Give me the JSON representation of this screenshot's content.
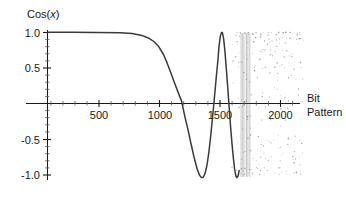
{
  "chart_data": {
    "type": "line",
    "title": "Cos(x)",
    "xlabel": "Bit Pattern",
    "ylabel": "Cos(x)",
    "xlim": [
      0,
      2150
    ],
    "ylim": [
      -1.15,
      1.15
    ],
    "grid": false,
    "legend": null,
    "x_ticks": [
      500,
      1000,
      1500,
      2000
    ],
    "x_tick_labels": [
      "500",
      "1000",
      "1500",
      "2000"
    ],
    "y_ticks": [
      -1.0,
      -0.5,
      0.5,
      1.0
    ],
    "y_tick_labels": [
      "-1.0",
      "-0.5",
      "0.5",
      "1.0"
    ],
    "y_zero_line": 0,
    "minor_ticks": true,
    "series": [
      {
        "name": "Cos(x)",
        "color": "#3a3a3a",
        "description": "Cosine of a rapidly growing argument; period shrinks with x so sampling aliases into noise beyond x~1450",
        "regime_smooth_end": 1450,
        "regime_aliased_start": 1450,
        "samples_note": "Curve traced from plotted pixels",
        "key_points": [
          {
            "x": 0,
            "y": 1.0
          },
          {
            "x": 200,
            "y": 1.0
          },
          {
            "x": 400,
            "y": 1.0
          },
          {
            "x": 600,
            "y": 0.99
          },
          {
            "x": 700,
            "y": 0.97
          },
          {
            "x": 780,
            "y": 0.92
          },
          {
            "x": 840,
            "y": 0.83
          },
          {
            "x": 880,
            "y": 0.72
          },
          {
            "x": 920,
            "y": 0.55
          },
          {
            "x": 960,
            "y": 0.33
          },
          {
            "x": 1000,
            "y": 0.06
          },
          {
            "x": 1030,
            "y": -0.2
          },
          {
            "x": 1060,
            "y": -0.47
          },
          {
            "x": 1090,
            "y": -0.72
          },
          {
            "x": 1120,
            "y": -0.91
          },
          {
            "x": 1150,
            "y": -1.0
          },
          {
            "x": 1180,
            "y": -0.95
          },
          {
            "x": 1205,
            "y": -0.78
          },
          {
            "x": 1230,
            "y": -0.45
          },
          {
            "x": 1255,
            "y": -0.05
          },
          {
            "x": 1275,
            "y": 0.4
          },
          {
            "x": 1295,
            "y": 0.78
          },
          {
            "x": 1315,
            "y": 0.98
          },
          {
            "x": 1330,
            "y": 1.0
          },
          {
            "x": 1345,
            "y": 0.88
          },
          {
            "x": 1362,
            "y": 0.55
          },
          {
            "x": 1378,
            "y": 0.1
          },
          {
            "x": 1392,
            "y": -0.4
          },
          {
            "x": 1406,
            "y": -0.78
          },
          {
            "x": 1420,
            "y": -0.97
          },
          {
            "x": 1432,
            "y": -1.0
          },
          {
            "x": 1445,
            "y": -0.88
          }
        ]
      }
    ],
    "noise_region": {
      "x_start": 1450,
      "x_end": 2120,
      "y_min": -1.05,
      "y_max": 1.05,
      "style": "scattered dots forming moire/aliasing pattern",
      "dense_band_x": [
        1450,
        1505
      ],
      "color": "#7a7a7a"
    }
  }
}
